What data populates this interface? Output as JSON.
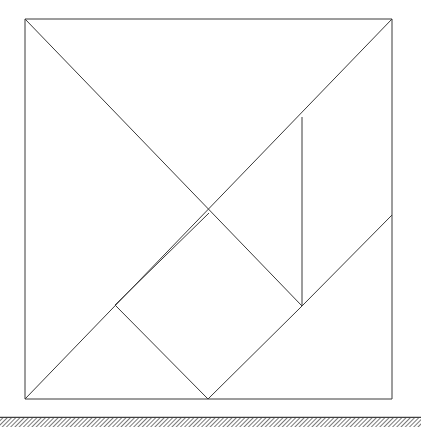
{
  "figure": {
    "title": "Tangram dissection of a square resting on hatched ground",
    "canvas": {
      "width": 421,
      "height": 431
    },
    "background_color": "#ffffff",
    "stroke_color": "#3a3a3a",
    "stroke_width": 1,
    "square": {
      "name": "outer-square",
      "x_left": 25,
      "y_top": 19,
      "x_right": 392,
      "y_bottom": 399,
      "width": 367,
      "height": 380
    },
    "key_points": {
      "top_left": [
        25,
        19
      ],
      "top_right": [
        392,
        19
      ],
      "bottom_left": [
        25,
        399
      ],
      "bottom_right": [
        392,
        399
      ],
      "center_crossing": [
        209,
        213
      ],
      "bottom_mid": [
        208,
        399
      ],
      "left_lower_junction": [
        115,
        305
      ],
      "vertical_top": [
        302,
        117
      ],
      "vertical_bottom": [
        302,
        306
      ],
      "right_edge_junction": [
        392,
        215
      ]
    },
    "segments": [
      {
        "name": "square-top-edge",
        "x1": 25,
        "y1": 19,
        "x2": 392,
        "y2": 19
      },
      {
        "name": "square-right-edge",
        "x1": 392,
        "y1": 19,
        "x2": 392,
        "y2": 399
      },
      {
        "name": "square-bottom-edge",
        "x1": 392,
        "y1": 399,
        "x2": 25,
        "y2": 399
      },
      {
        "name": "square-left-edge",
        "x1": 25,
        "y1": 399,
        "x2": 25,
        "y2": 19
      },
      {
        "name": "main-diagonal-tl-br",
        "x1": 25,
        "y1": 19,
        "x2": 302,
        "y2": 306
      },
      {
        "name": "diagonal-tr-bl",
        "x1": 392,
        "y1": 19,
        "x2": 25,
        "y2": 399
      },
      {
        "name": "vertical-divider",
        "x1": 302,
        "y1": 117,
        "x2": 302,
        "y2": 306
      },
      {
        "name": "diamond-left-upper",
        "x1": 209,
        "y1": 213,
        "x2": 115,
        "y2": 305
      },
      {
        "name": "diamond-left-lower",
        "x1": 115,
        "y1": 305,
        "x2": 208,
        "y2": 399
      },
      {
        "name": "diamond-right-lower",
        "x1": 208,
        "y1": 399,
        "x2": 302,
        "y2": 306
      },
      {
        "name": "diagonal-center-to-right-edge",
        "x1": 302,
        "y1": 306,
        "x2": 392,
        "y2": 215
      }
    ],
    "ground": {
      "name": "ground-hatching",
      "y_line": 417,
      "x_start": 0,
      "x_end": 421,
      "band_height": 9,
      "hatch_spacing": 3,
      "hatch_angle_deg": 45,
      "color": "#404040"
    }
  }
}
